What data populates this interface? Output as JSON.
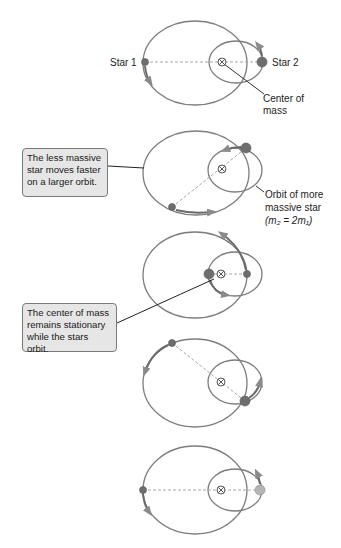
{
  "colors": {
    "orbit": "#7d7d7d",
    "motion_arc": "#6a6a6a",
    "arrow_head": "#8a8a8a",
    "star": "#6e6e6e",
    "star_light": "#b4b4b4",
    "dashed_line": "#a8a8a8",
    "callout_fill": "#e6e6e6",
    "callout_border": "#7a7a7a",
    "leader": "#222222"
  },
  "labels": {
    "star1": "Star 1",
    "star2": "Star 2",
    "center_of_mass_line1": "Center of",
    "center_of_mass_line2": "mass",
    "orbit_more_massive_line1": "Orbit of more",
    "orbit_more_massive_line2": "massive star",
    "mass_ratio": "(m₂ = 2m₁)"
  },
  "callouts": [
    {
      "text": "The less massive\nstar moves faster\non a larger orbit."
    },
    {
      "text": "The center of mass\nremains stationary\nwhile the stars orbit."
    }
  ],
  "panels": [
    {
      "id": 1,
      "com": [
        222,
        62
      ],
      "star1": [
        145,
        62
      ],
      "star2": [
        262,
        62
      ],
      "star2_shade": "dark"
    },
    {
      "id": 2,
      "com": [
        222,
        169
      ],
      "star1": [
        172,
        207
      ],
      "star2": [
        246,
        148
      ],
      "star2_shade": "dark"
    },
    {
      "id": 3,
      "com": [
        221,
        274
      ],
      "star1": [
        247,
        274
      ],
      "star2": [
        209,
        274
      ],
      "star2_shade": "dark"
    },
    {
      "id": 4,
      "com": [
        221,
        382
      ],
      "star1": [
        172,
        343
      ],
      "star2": [
        245,
        401
      ],
      "star2_shade": "dark"
    },
    {
      "id": 5,
      "com": [
        221,
        490
      ],
      "star1": [
        143,
        490
      ],
      "star2": [
        260,
        490
      ],
      "star2_shade": "light"
    }
  ]
}
